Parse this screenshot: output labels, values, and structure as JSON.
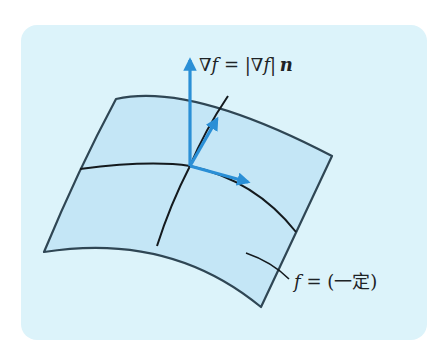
{
  "figure": {
    "type": "level-surface-gradient",
    "colors": {
      "panel_background": "#dcf3fa",
      "surface_fill": "#c4e6f6",
      "surface_edge": "#2f4654",
      "grid_line": "#141a1e",
      "vector": "#2a8fd6"
    },
    "labels": {
      "gradient_nabla": "∇",
      "gradient_f": "f",
      "gradient_eq": " = |∇",
      "gradient_f2": "f",
      "gradient_bar": "|",
      "gradient_n": "n",
      "level_f": "f",
      "level_rest": " = (一定)"
    },
    "vectors": [
      {
        "name": "gradient-vector",
        "from": [
          190,
          166
        ],
        "to": [
          190,
          58
        ]
      },
      {
        "name": "tangent-vector-1",
        "from": [
          190,
          166
        ],
        "to": [
          218,
          117
        ]
      },
      {
        "name": "tangent-vector-2",
        "from": [
          190,
          166
        ],
        "to": [
          250,
          183
        ]
      }
    ]
  }
}
